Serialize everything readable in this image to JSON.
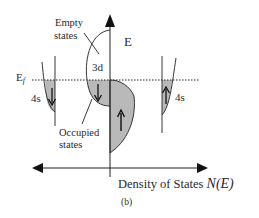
{
  "figure": {
    "panel_label": "(b)",
    "axes": {
      "y_axis_label": "E",
      "x_axis_label": "Density of States",
      "x_axis_symbol": "N(E)"
    },
    "fermi_level": {
      "label_main": "E",
      "label_sub": "f",
      "style": "dotted"
    },
    "bands": {
      "band_3d": {
        "label": "3d",
        "spin_down_arrow": "↓",
        "spin_up_arrow": "↑"
      },
      "band_4s_left": {
        "label": "4s",
        "spin_arrow": "↓"
      },
      "band_4s_right": {
        "label": "4s",
        "spin_arrow": "↑"
      }
    },
    "annotations": {
      "empty_states": {
        "line1": "Empty",
        "line2": "states"
      },
      "occupied_states": {
        "line1": "Occupied",
        "line2": "states"
      }
    },
    "colors": {
      "filled_band": "#b9b9b9",
      "line": "#222222",
      "background": "#ffffff"
    }
  }
}
